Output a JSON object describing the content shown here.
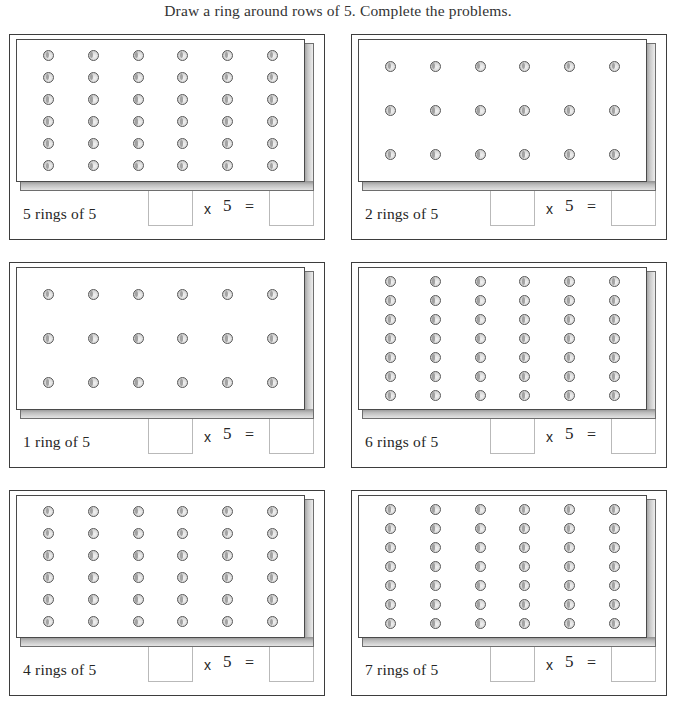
{
  "worksheet": {
    "title": "Draw a ring around rows of 5. Complete the problems.",
    "multiplier": "5",
    "times_symbol": "x",
    "equals_symbol": "=",
    "answer_box_value": "",
    "dot_icon_name": "ring-bead-icon"
  },
  "problems": [
    {
      "label": "5 rings of 5",
      "rings": 5,
      "rows": 6,
      "cols": 6,
      "spacing": "tight",
      "multiplier": "5",
      "times_symbol": "x",
      "equals_symbol": "=",
      "factor_box_value": "",
      "product_box_value": ""
    },
    {
      "label": "2 rings of 5",
      "rings": 2,
      "rows": 3,
      "cols": 6,
      "spacing": "wide",
      "multiplier": "5",
      "times_symbol": "x",
      "equals_symbol": "=",
      "factor_box_value": "",
      "product_box_value": ""
    },
    {
      "label": "1 ring of 5",
      "rings": 1,
      "rows": 3,
      "cols": 6,
      "spacing": "wide",
      "multiplier": "5",
      "times_symbol": "x",
      "equals_symbol": "=",
      "factor_box_value": "",
      "product_box_value": ""
    },
    {
      "label": "6 rings of 5",
      "rings": 6,
      "rows": 7,
      "cols": 6,
      "spacing": "tight",
      "multiplier": "5",
      "times_symbol": "x",
      "equals_symbol": "=",
      "factor_box_value": "",
      "product_box_value": ""
    },
    {
      "label": "4 rings of 5",
      "rings": 4,
      "rows": 6,
      "cols": 6,
      "spacing": "tight",
      "multiplier": "5",
      "times_symbol": "x",
      "equals_symbol": "=",
      "factor_box_value": "",
      "product_box_value": ""
    },
    {
      "label": "7 rings of 5",
      "rings": 7,
      "rows": 7,
      "cols": 6,
      "spacing": "tight",
      "multiplier": "5",
      "times_symbol": "x",
      "equals_symbol": "=",
      "factor_box_value": "",
      "product_box_value": ""
    }
  ],
  "colors": {
    "page_background": "#ffffff",
    "text": "#2b2b2b",
    "panel_border": "#3d3d3d",
    "slab_border": "#4a4a4a",
    "slab_shadow": "#9b9b9b",
    "dot_outline": "#575757",
    "dot_fill": "#dcdcdc",
    "answer_box_border": "#b9b9b9"
  }
}
